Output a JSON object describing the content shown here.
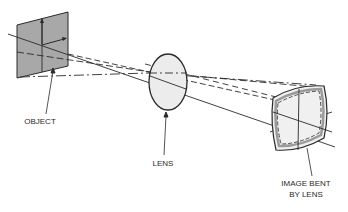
{
  "diagram": {
    "type": "optics-ray-diagram",
    "labels": {
      "object": "OBJECT",
      "lens": "LENS",
      "image_line1": "IMAGE BENT",
      "image_line2": "BY LENS"
    },
    "colors": {
      "line": "#2a2a2a",
      "object_fill": "#a8a8a8",
      "lens_fill": "#ececec",
      "image_fill": "#f0f0f0",
      "image_shade": "#9a9a9a",
      "background": "#ffffff"
    }
  }
}
